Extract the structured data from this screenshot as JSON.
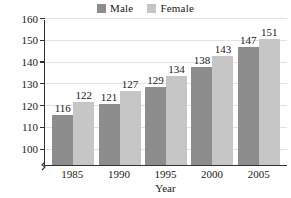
{
  "chart_data": {
    "type": "bar",
    "title": "",
    "xlabel": "Year",
    "ylabel": "Population (millions)",
    "categories": [
      "1985",
      "1990",
      "1995",
      "2000",
      "2005"
    ],
    "series": [
      {
        "name": "Male",
        "color": "#8d8d8d",
        "values": [
          116,
          121,
          129,
          138,
          147
        ]
      },
      {
        "name": "Female",
        "color": "#c6c6c6",
        "values": [
          122,
          127,
          134,
          143,
          151
        ]
      }
    ],
    "ylim": [
      93,
      160
    ],
    "yticks": [
      100,
      110,
      120,
      130,
      140,
      150,
      160
    ],
    "ytick_labels": [
      "100",
      "110",
      "120",
      "130",
      "140",
      "150",
      "160"
    ],
    "axis_break": true,
    "grid": true,
    "grid_axis": "y",
    "legend_position": "top-center",
    "data_labels": true
  }
}
